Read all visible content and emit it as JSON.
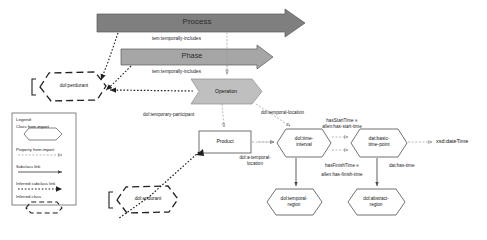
{
  "diagram": {
    "colors": {
      "process_fill": "#7f7f7f",
      "phase_fill": "#a6a6a6",
      "operation_fill": "#bfbfbf",
      "stroke": "#595959",
      "text": "#1a1a1a",
      "background": "#ffffff"
    },
    "bands": [
      {
        "label": "Process",
        "fill": "#7f7f7f"
      },
      {
        "label": "Phase",
        "fill": "#a6a6a6"
      }
    ],
    "nodes": {
      "operation": "Operation",
      "product": "Product",
      "perdurant": "dol:perdurant",
      "endurant": "dol:endurant",
      "time_interval_l1": "dol:time-",
      "time_interval_l2": "interval",
      "basic_time_point_l1": "dat:basic-",
      "basic_time_point_l2": "time-point",
      "temporal_region_l1": "dol:temporal-",
      "temporal_region_l2": "region",
      "abstract_region_l1": "dol:abstract-",
      "abstract_region_l2": "region",
      "xsd_datetime": "xsd:dateTime"
    },
    "edge_labels": {
      "temporally_includes_1": "tem:temporally-includes",
      "temporally_includes_2": "tem:temporally-includes",
      "temporary_participant": "dol:temporary-participant",
      "temporal_location": "dol:temporal-location",
      "a_temporal_location_l1": "dol:a-temporal-",
      "a_temporal_location_l2": "location",
      "has_start_time_l1": "hasStartTime ≡",
      "has_start_time_l2": "allen:has-start-time",
      "has_finish_time_l1": "hasFinishTime ≡",
      "has_finish_time_l2": "allen:has-finish-time",
      "dat_has_time": "dat:has-time"
    },
    "legend": {
      "title": "Legend:",
      "items": [
        {
          "label": "Class from import",
          "kind": "hexagon-solid"
        },
        {
          "label": "Property from import",
          "kind": "dashed-arrow"
        },
        {
          "label": "Subclass link",
          "kind": "solid-arrow"
        },
        {
          "label": "Inferred subclass link",
          "kind": "dotted-arrow"
        },
        {
          "label": "Inferred class",
          "kind": "hexagon-dashed"
        }
      ]
    }
  }
}
